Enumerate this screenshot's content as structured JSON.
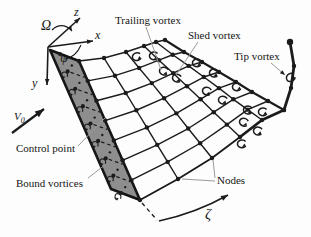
{
  "figure": {
    "labels": {
      "trailing_vortex": "Trailing vortex",
      "shed_vortex": "Shed vortex",
      "tip_vortex": "Tip vortex",
      "control_point": "Control point",
      "bound_vortices": "Bound vortices",
      "nodes": "Nodes",
      "zeta": "ζ",
      "omega": "Ω",
      "psi": "ψ",
      "axis_x": "x",
      "axis_y": "y",
      "axis_z": "z",
      "velocity_main": "V",
      "velocity_sub": "0"
    },
    "colors": {
      "ink": "#1b1b1b",
      "leader": "#9a9a9a",
      "plate_fill": "#8e8e8e",
      "plate_edge": "#161616",
      "background": "#fdfdfd"
    },
    "geometry": {
      "origin": [
        48,
        47
      ],
      "axes": {
        "z_tip": [
          80,
          18
        ],
        "x_tip": [
          93,
          41
        ],
        "y_tip": [
          47,
          85
        ]
      },
      "omega_arc": {
        "from": [
          52,
          30
        ],
        "ctrl": [
          62,
          21
        ],
        "to": [
          72,
          31
        ]
      },
      "psi_arc": {
        "from": [
          81,
          45
        ],
        "ctrl": [
          76,
          57
        ],
        "to": [
          65,
          59
        ]
      },
      "v0_arrow": {
        "from": [
          12,
          133
        ],
        "to": [
          44,
          109
        ]
      },
      "plate": {
        "corners": [
          [
            50,
            50
          ],
          [
            79,
            61
          ],
          [
            140,
            200
          ],
          [
            111,
            189
          ]
        ],
        "bound_from": [
          60,
          54
        ],
        "bound_to": [
          121,
          193
        ],
        "bound_count": 9,
        "control_offset": [
          18,
          6.8
        ],
        "control_count": 8
      },
      "wake": {
        "te_top": [
          79,
          61
        ],
        "te_bot": [
          140,
          200
        ],
        "rows": 8,
        "cols": 6,
        "row0": [
          [
            79,
            61
          ],
          [
            104,
            58
          ],
          [
            126,
            52
          ],
          [
            144,
            46
          ],
          [
            156,
            42
          ],
          [
            165,
            40
          ]
        ],
        "tip_row": [
          [
            140,
            200
          ],
          [
            178,
            179
          ],
          [
            212,
            158
          ],
          [
            240,
            137
          ],
          [
            262,
            120
          ],
          [
            284,
            110
          ]
        ],
        "old_edge": [
          [
            165,
            40
          ],
          [
            184,
            52
          ],
          [
            202,
            62
          ],
          [
            219,
            72
          ],
          [
            236,
            82
          ],
          [
            252,
            92
          ],
          [
            268,
            101
          ],
          [
            284,
            110
          ]
        ],
        "tip_ext": [
          [
            284,
            110
          ],
          [
            291,
            88
          ],
          [
            294,
            66
          ],
          [
            290,
            42
          ]
        ],
        "thick_from_col": 3
      },
      "zeta": {
        "dash_from": [
          142,
          203
        ],
        "dash_to": [
          157,
          220
        ],
        "curve_from": [
          159,
          221
        ],
        "curve_ctrl": [
          196,
          213
        ],
        "curve_to": [
          228,
          195
        ]
      },
      "curls": [
        {
          "x": 136,
          "y": 57,
          "r": -10
        },
        {
          "x": 153,
          "y": 56,
          "r": 0
        },
        {
          "x": 163,
          "y": 71,
          "r": 15
        },
        {
          "x": 176,
          "y": 78,
          "r": 15
        },
        {
          "x": 196,
          "y": 63,
          "r": 0
        },
        {
          "x": 213,
          "y": 73,
          "r": 10
        },
        {
          "x": 206,
          "y": 91,
          "r": 20
        },
        {
          "x": 222,
          "y": 100,
          "r": 15
        },
        {
          "x": 236,
          "y": 87,
          "r": 0
        },
        {
          "x": 247,
          "y": 110,
          "r": 10
        },
        {
          "x": 243,
          "y": 122,
          "r": 20
        },
        {
          "x": 257,
          "y": 131,
          "r": 10
        },
        {
          "x": 241,
          "y": 144,
          "r": 0
        },
        {
          "x": 262,
          "y": 112,
          "r": 0
        },
        {
          "x": 290,
          "y": 78,
          "r": -30
        }
      ],
      "leaders": {
        "trailing": {
          "from": [
            146,
            27
          ],
          "to": [
            161,
            70
          ]
        },
        "shed": {
          "from": [
            198,
            42
          ],
          "to": [
            176,
            75
          ]
        },
        "tip": {
          "from": [
            271,
            63
          ],
          "to": [
            285,
            75
          ],
          "arrow": true
        },
        "control": {
          "from": [
            78,
            146
          ],
          "to": [
            105,
            118
          ]
        },
        "bound": {
          "from": [
            88,
            178
          ],
          "to": [
            110,
            161
          ]
        },
        "nodes_a": {
          "from": [
            215,
            178
          ],
          "to": [
            213,
            160
          ]
        },
        "nodes_b": {
          "from": [
            215,
            181
          ],
          "to": [
            182,
            179
          ]
        }
      },
      "label_pos": {
        "trailing_vortex": [
          115,
          24
        ],
        "shed_vortex": [
          188,
          39
        ],
        "tip_vortex": [
          234,
          60
        ],
        "control_point": [
          16,
          152
        ],
        "bound_vortices": [
          16,
          187
        ],
        "nodes": [
          217,
          184
        ],
        "zeta": [
          205,
          219
        ],
        "omega": [
          41,
          30
        ],
        "psi": [
          60,
          62
        ],
        "axis_z": [
          74,
          16
        ],
        "axis_x": [
          95,
          39
        ],
        "axis_y": [
          32,
          87
        ],
        "velocity": [
          14,
          120
        ]
      }
    }
  }
}
